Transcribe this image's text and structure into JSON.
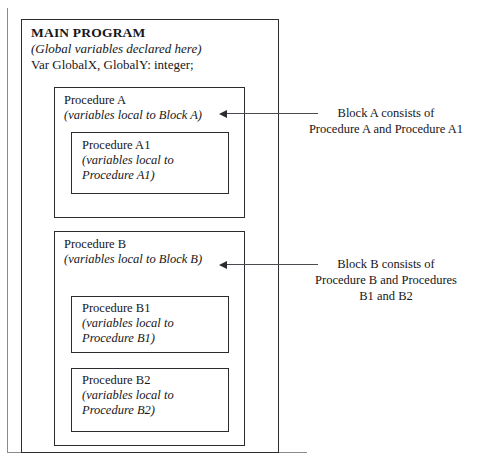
{
  "diagram": {
    "main": {
      "heading": "MAIN PROGRAM",
      "subtitle": "(Global variables declared here)",
      "declaration": "Var GlobalX, GlobalY: integer;"
    },
    "procedures": [
      {
        "id": "procedure-a",
        "heading": "Procedure A",
        "subtitle": "(variables local to Block A)",
        "children": [
          {
            "id": "procedure-a1",
            "heading": "Procedure A1",
            "subtitle": "(variables local to\nProcedure A1)"
          }
        ]
      },
      {
        "id": "procedure-b",
        "heading": "Procedure B",
        "subtitle": "(variables local to Block B)",
        "children": [
          {
            "id": "procedure-b1",
            "heading": "Procedure B1",
            "subtitle": "(variables local to\nProcedure B1)"
          },
          {
            "id": "procedure-b2",
            "heading": "Procedure B2",
            "subtitle": "(variables local to\nProcedure B2)"
          }
        ]
      }
    ],
    "annotations": [
      {
        "id": "annotation-block-a",
        "text": "Block A consists of\nProcedure A and Procedure A1",
        "points_to": "procedure-a"
      },
      {
        "id": "annotation-block-b",
        "text": "Block B consists of\nProcedure B and Procedures\nB1 and B2",
        "points_to": "procedure-b"
      }
    ],
    "colors": {
      "background": "#ffffff",
      "box_border": "#2b2b30",
      "frame_rule": "#8a8a8e",
      "text": "#16161a",
      "leader_line": "#4a4a50"
    }
  }
}
